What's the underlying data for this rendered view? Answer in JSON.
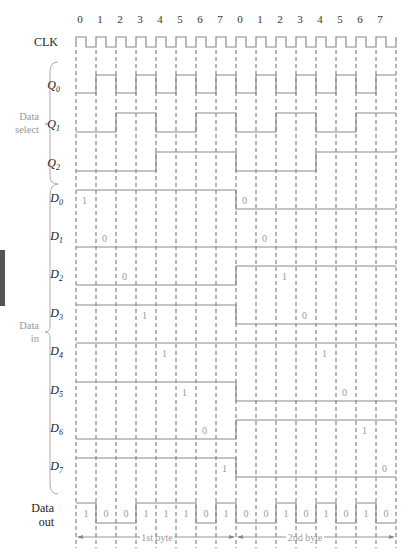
{
  "diagram": {
    "type": "timing-diagram",
    "clock_label": "CLK",
    "clock_ticks": [
      "0",
      "1",
      "2",
      "3",
      "4",
      "5",
      "6",
      "7",
      "0",
      "1",
      "2",
      "3",
      "4",
      "5",
      "6",
      "7"
    ],
    "groups": {
      "data_select": {
        "line1": "Data",
        "line2": "select"
      },
      "data_in": {
        "line1": "Data",
        "line2": "in"
      }
    },
    "select_signals": [
      {
        "name": "Q",
        "sub": "0",
        "values": [
          0,
          1,
          0,
          1,
          0,
          1,
          0,
          1,
          0,
          1,
          0,
          1,
          0,
          1,
          0,
          1
        ]
      },
      {
        "name": "Q",
        "sub": "1",
        "values": [
          0,
          0,
          1,
          1,
          0,
          0,
          1,
          1,
          0,
          0,
          1,
          1,
          0,
          0,
          1,
          1
        ]
      },
      {
        "name": "Q",
        "sub": "2",
        "values": [
          0,
          0,
          0,
          0,
          1,
          1,
          1,
          1,
          0,
          0,
          0,
          0,
          1,
          1,
          1,
          1
        ]
      }
    ],
    "data_signals": [
      {
        "name": "D",
        "sub": "0",
        "byte1": 1,
        "byte2": 0,
        "label1": "1",
        "label2": "0"
      },
      {
        "name": "D",
        "sub": "1",
        "byte1": 0,
        "byte2": 0,
        "label1": "0",
        "label2": "0"
      },
      {
        "name": "D",
        "sub": "2",
        "byte1": 0,
        "byte2": 1,
        "label1": "0",
        "label2": "1"
      },
      {
        "name": "D",
        "sub": "3",
        "byte1": 1,
        "byte2": 0,
        "label1": "1",
        "label2": "0"
      },
      {
        "name": "D",
        "sub": "4",
        "byte1": 1,
        "byte2": 1,
        "label1": "1",
        "label2": "1"
      },
      {
        "name": "D",
        "sub": "5",
        "byte1": 1,
        "byte2": 0,
        "label1": "1",
        "label2": "0"
      },
      {
        "name": "D",
        "sub": "6",
        "byte1": 0,
        "byte2": 1,
        "label1": "0",
        "label2": "1"
      },
      {
        "name": "D",
        "sub": "7",
        "byte1": 1,
        "byte2": 0,
        "label1": "1",
        "label2": "0"
      }
    ],
    "data_out": {
      "line1": "Data",
      "line2": "out",
      "values": [
        1,
        0,
        0,
        1,
        1,
        1,
        0,
        1,
        0,
        0,
        1,
        0,
        1,
        0,
        1,
        0
      ],
      "labels": [
        "1",
        "0",
        "0",
        "1",
        "1",
        "1",
        "0",
        "1",
        "0",
        "0",
        "1",
        "0",
        "1",
        "0",
        "1",
        "0"
      ]
    },
    "bytes": [
      {
        "label": "1st byte"
      },
      {
        "label": "2nd byte"
      }
    ]
  }
}
